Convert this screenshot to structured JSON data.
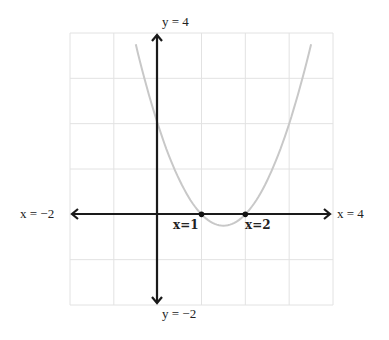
{
  "chart_data": {
    "type": "line",
    "title": "",
    "function": "y = (x-1)(x-2)",
    "xlim": [
      -2,
      4
    ],
    "ylim": [
      -2,
      4
    ],
    "grid": true,
    "axis_labels": {
      "x_min": "x = −2",
      "x_max": "x = 4",
      "y_max": "y = 4",
      "y_min": "y = −2"
    },
    "series": [
      {
        "name": "parabola",
        "x": [
          -0.5,
          0,
          0.5,
          1,
          1.5,
          2,
          2.5,
          3,
          3.5
        ],
        "y": [
          3.75,
          2,
          0.75,
          0,
          -0.25,
          0,
          0.75,
          2,
          3.75
        ],
        "color": "#c8c8c8"
      }
    ],
    "points": [
      {
        "label": "x=1",
        "x": 1,
        "y": 0
      },
      {
        "label": "x=2",
        "x": 2,
        "y": 0
      }
    ]
  }
}
